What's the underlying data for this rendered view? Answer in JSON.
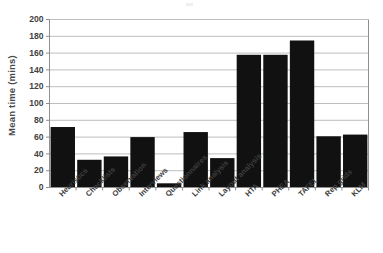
{
  "chart_data": {
    "type": "bar",
    "title": "",
    "xlabel": "",
    "ylabel": "Mean time (mins)",
    "ylim": [
      0,
      200
    ],
    "ytick_step": 20,
    "yticks": [
      0,
      20,
      40,
      60,
      80,
      100,
      120,
      140,
      160,
      180,
      200
    ],
    "grid": true,
    "legend": "none",
    "bar_color": "#111111",
    "gridline_color": "#b5b5b5",
    "categories": [
      "Heuristics",
      "Checklists",
      "Observation",
      "Interviews",
      "Questionnaires",
      "Link analysis",
      "Layout analysis",
      "HTA",
      "PHEA",
      "TAFEI",
      "Rep grids",
      "KLM"
    ],
    "values": [
      72,
      33,
      37,
      60,
      5,
      66,
      35,
      158,
      158,
      175,
      61,
      63
    ]
  }
}
